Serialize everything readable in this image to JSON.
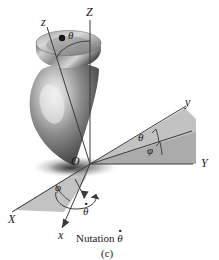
{
  "figure": {
    "caption": "(c)",
    "annotation": "Nutation",
    "annotation_symbol": "θ"
  },
  "axes": {
    "fixed": [
      {
        "name": "Z-axis",
        "label": "Z"
      },
      {
        "name": "X-axis",
        "label": "X"
      },
      {
        "name": "Y-axis",
        "label": "Y"
      }
    ],
    "body": [
      {
        "name": "z-axis",
        "label": "z"
      },
      {
        "name": "x-axis",
        "label": "x"
      },
      {
        "name": "y-axis",
        "label": "y"
      }
    ],
    "origin": {
      "name": "origin",
      "label": "O"
    }
  },
  "angles": [
    {
      "name": "theta-top",
      "label": "θ"
    },
    {
      "name": "theta-plane",
      "label": "θ"
    },
    {
      "name": "phi-plane",
      "label": "φ"
    },
    {
      "name": "phi-lower",
      "label": "φ"
    }
  ],
  "rates": [
    {
      "name": "theta-dot-arrow",
      "symbol": "θ"
    }
  ],
  "colors": {
    "line": "#3a3a3a",
    "wedge_fill": "#b9b9b9",
    "wedge_fill_dark": "#a8a8a8",
    "top_light": "#e6e6e6",
    "top_mid": "#8e8e8e",
    "top_dark": "#3c3c3c",
    "shadow": "#6b6b6b",
    "text": "#1a1a1a",
    "background": "#ffffff"
  }
}
